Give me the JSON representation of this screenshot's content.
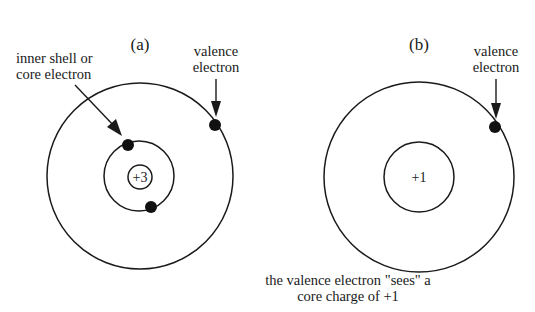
{
  "diagram": {
    "caption": {
      "line1": "the valence electron \"sees\" a",
      "line2": "core charge of +1"
    },
    "panels": [
      {
        "id": "a",
        "label": "(a)",
        "nucleus_charge": "+3",
        "annotations": {
          "core_line1": "inner shell or",
          "core_line2": "core electron",
          "valence_line1": "valence",
          "valence_line2": "electron"
        },
        "shells": [
          "inner",
          "outer"
        ],
        "core_electrons": 2,
        "valence_electrons": 1
      },
      {
        "id": "b",
        "label": "(b)",
        "nucleus_charge": "+1",
        "annotations": {
          "valence_line1": "valence",
          "valence_line2": "electron"
        },
        "shells": [
          "core",
          "outer"
        ],
        "valence_electrons": 1
      }
    ],
    "colors": {
      "line": "#1a1a1a",
      "electron": "#111111",
      "background": "#ffffff"
    }
  }
}
